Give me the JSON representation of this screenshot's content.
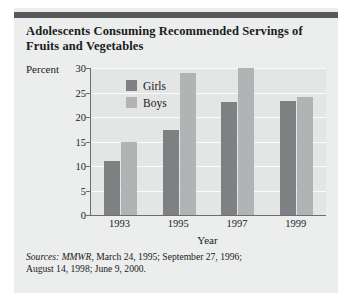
{
  "title": "Adolescents Consuming Recommended Servings of Fruits and Vegetables",
  "sources": {
    "label": "Sources:",
    "publication": "MMWR",
    "line1_rest": ", March 24, 1995; September 27, 1996;",
    "line2": "August 14, 1998; June 9, 2000."
  },
  "colors": {
    "girls": "#7f8082",
    "boys": "#b2b3b4",
    "plot_background": "#e4e5e5",
    "card_background": "#eceded",
    "rule": "#58585a",
    "axis": "#6d6e70",
    "gridline": "#fbfbfb",
    "text": "#1b1b1b"
  },
  "chart_data": {
    "type": "bar",
    "title": "Adolescents Consuming Recommended Servings of Fruits and Vegetables",
    "xlabel": "Year",
    "ylabel": "Percent",
    "categories": [
      "1993",
      "1995",
      "1997",
      "1999"
    ],
    "series": [
      {
        "name": "Girls",
        "values": [
          11,
          17.3,
          23,
          23.2
        ]
      },
      {
        "name": "Boys",
        "values": [
          15,
          29,
          30,
          24
        ]
      }
    ],
    "ylim": [
      0,
      30
    ],
    "yticks": [
      0,
      5,
      10,
      15,
      20,
      25,
      30
    ],
    "ytick_labels": [
      "0",
      "5",
      "10",
      "15",
      "20",
      "25",
      "30"
    ],
    "grid": true,
    "legend_position": "top-left-inside"
  }
}
